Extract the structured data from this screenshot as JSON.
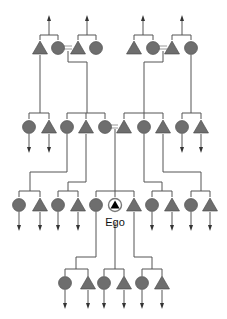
{
  "ego_label": "Ego",
  "colors": {
    "symbol_fill": "#6e6e6e",
    "line": "#555555",
    "marriage": "#9a9a9a",
    "ego": "#000000"
  },
  "legend": {
    "triangle": "male",
    "circle": "female",
    "equals": "marriage"
  },
  "generations": [
    {
      "level": "G+2",
      "y": 48,
      "members": [
        {
          "sex": "male",
          "x": 40
        },
        {
          "sex": "female",
          "x": 58
        },
        {
          "sex": "male",
          "x": 78
        },
        {
          "sex": "female",
          "x": 96
        },
        {
          "sex": "male",
          "x": 134
        },
        {
          "sex": "female",
          "x": 153
        },
        {
          "sex": "male",
          "x": 172
        },
        {
          "sex": "female",
          "x": 191
        }
      ]
    },
    {
      "level": "G+1",
      "y": 127,
      "members": [
        {
          "sex": "female",
          "x": 29
        },
        {
          "sex": "male",
          "x": 49
        },
        {
          "sex": "female",
          "x": 67
        },
        {
          "sex": "male",
          "x": 86
        },
        {
          "sex": "female",
          "x": 105
        },
        {
          "sex": "male",
          "x": 124
        },
        {
          "sex": "female",
          "x": 144
        },
        {
          "sex": "male",
          "x": 163
        },
        {
          "sex": "female",
          "x": 182
        },
        {
          "sex": "male",
          "x": 201
        }
      ]
    },
    {
      "level": "G0",
      "y": 205,
      "members": [
        {
          "sex": "female",
          "x": 19
        },
        {
          "sex": "male",
          "x": 40
        },
        {
          "sex": "female",
          "x": 58
        },
        {
          "sex": "male",
          "x": 78
        },
        {
          "sex": "female",
          "x": 96
        },
        {
          "sex": "ego",
          "x": 115
        },
        {
          "sex": "male",
          "x": 134
        },
        {
          "sex": "female",
          "x": 152
        },
        {
          "sex": "male",
          "x": 172
        },
        {
          "sex": "female",
          "x": 191
        },
        {
          "sex": "male",
          "x": 210
        }
      ]
    },
    {
      "level": "G-1",
      "y": 283,
      "members": [
        {
          "sex": "female",
          "x": 65
        },
        {
          "sex": "male",
          "x": 88
        },
        {
          "sex": "female",
          "x": 104
        },
        {
          "sex": "male",
          "x": 124
        },
        {
          "sex": "female",
          "x": 142
        },
        {
          "sex": "male",
          "x": 162
        }
      ]
    }
  ]
}
